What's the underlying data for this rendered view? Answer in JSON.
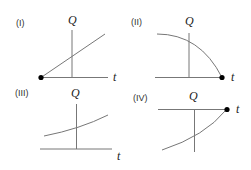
{
  "panels": [
    {
      "label": "(I)",
      "y_axis": "Q",
      "x_axis": "t",
      "description": "straight line increasing from origin dot at left end of t-axis"
    },
    {
      "label": "(II)",
      "y_axis": "Q",
      "x_axis": "t",
      "description": "concave-down curve decreasing to dot at right end of t-axis"
    },
    {
      "label": "(III)",
      "y_axis": "Q",
      "x_axis": "t",
      "description": "slightly concave-up increasing curve above t-axis"
    },
    {
      "label": "(IV)",
      "y_axis": "Q",
      "x_axis": "t",
      "description": "concave-down increasing curve below t-axis ending at dot at right end of t-axis"
    }
  ],
  "colors": {
    "axis": "#777777",
    "curve": "#777777",
    "dot": "#000000",
    "text": "#222222"
  }
}
